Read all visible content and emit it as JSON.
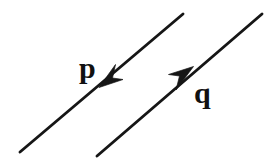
{
  "figure": {
    "type": "vector-diagram",
    "background_color": "#ffffff",
    "stroke_color": "#161616",
    "canvas": {
      "width": 276,
      "height": 164
    }
  },
  "vectors": [
    {
      "id": "p",
      "label": "p",
      "label_style": "bold-serif",
      "label_position": {
        "x": 79,
        "y": 53
      },
      "line": {
        "x1": 20,
        "y1": 152,
        "x2": 183,
        "y2": 14
      },
      "direction": "down-left",
      "arrow_tip": {
        "x": 99,
        "y": 86
      },
      "arrow_angle_deg": 220,
      "color": "#161616"
    },
    {
      "id": "q",
      "label": "q",
      "label_style": "bold-serif",
      "label_position": {
        "x": 194,
        "y": 78
      },
      "line": {
        "x1": 97,
        "y1": 156,
        "x2": 262,
        "y2": 14
      },
      "direction": "up-right",
      "arrow_tip": {
        "x": 193,
        "y": 68
      },
      "arrow_angle_deg": 40,
      "color": "#161616"
    }
  ]
}
